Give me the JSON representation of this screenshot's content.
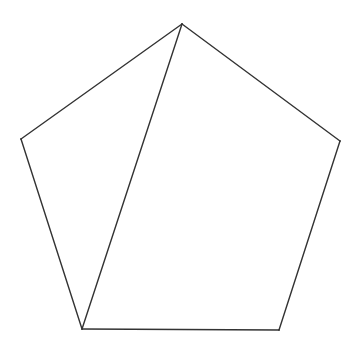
{
  "diagram": {
    "type": "geometric-figure",
    "shape": "pentagon",
    "vertices": [
      "top",
      "upper-left",
      "lower-left",
      "lower-right",
      "upper-right"
    ],
    "edges": [
      {
        "from": "top",
        "to": "upper-right",
        "kind": "side"
      },
      {
        "from": "upper-right",
        "to": "lower-right",
        "kind": "side"
      },
      {
        "from": "lower-right",
        "to": "lower-left",
        "kind": "side"
      },
      {
        "from": "lower-left",
        "to": "upper-left",
        "kind": "side"
      },
      {
        "from": "upper-left",
        "to": "top",
        "kind": "side"
      },
      {
        "from": "top",
        "to": "lower-left",
        "kind": "diagonal"
      }
    ],
    "stroke_color": "#333333",
    "background_color": "#ffffff",
    "labels": []
  }
}
